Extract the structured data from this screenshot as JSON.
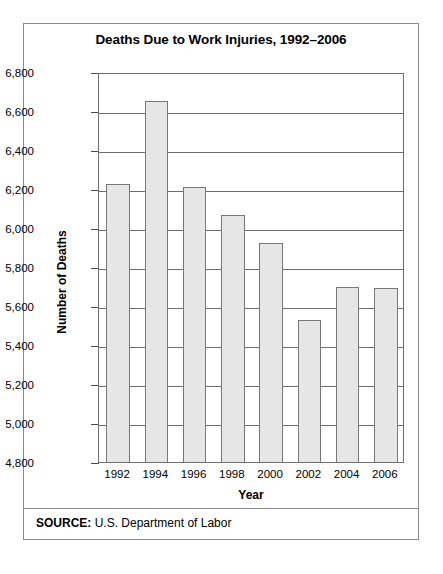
{
  "chart_data": {
    "type": "bar",
    "title": "Deaths Due to Work Injuries, 1992–2006",
    "xlabel": "Year",
    "ylabel": "Number of Deaths",
    "categories": [
      "1992",
      "1994",
      "1996",
      "1998",
      "2000",
      "2002",
      "2004",
      "2006"
    ],
    "values": [
      6225,
      6650,
      6210,
      6065,
      5925,
      5530,
      5700,
      5690
    ],
    "ylim": [
      4800,
      6800
    ],
    "ytick_step": 200,
    "yticks": [
      "6,800",
      "6,600",
      "6,400",
      "6,200",
      "6,000",
      "5,800",
      "5,600",
      "5,400",
      "5,200",
      "5,000",
      "4,800"
    ],
    "ytick_values": [
      6800,
      6600,
      6400,
      6200,
      6000,
      5800,
      5600,
      5400,
      5200,
      5000,
      4800
    ],
    "grid": true,
    "legend": "none",
    "bar_color": "#e6e6e6",
    "bar_border_color": "#777777",
    "axis_color": "#6e6e6e"
  },
  "source": {
    "label": "SOURCE:",
    "text": " U.S. Department of Labor"
  }
}
